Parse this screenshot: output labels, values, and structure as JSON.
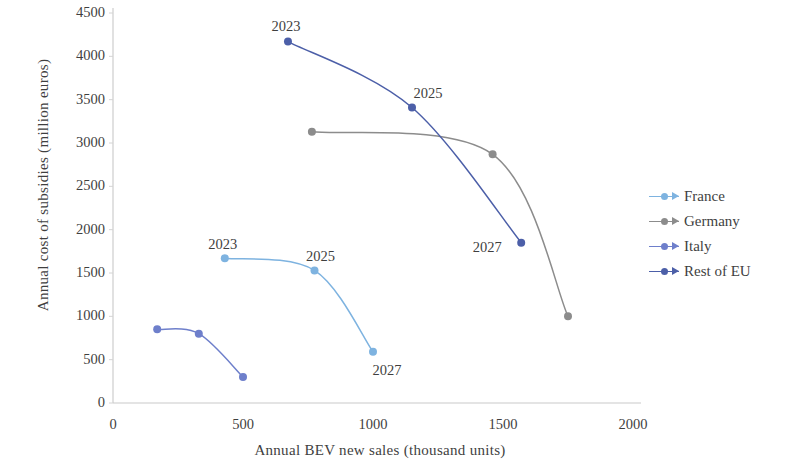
{
  "chart_data": {
    "type": "scatter",
    "title": "",
    "xlabel": "Annual BEV new sales (thousand units)",
    "ylabel": "Annual cost of subsidies (million euros)",
    "xlim": [
      0,
      2000
    ],
    "ylim": [
      0,
      4500
    ],
    "xticks": [
      "0",
      "500",
      "1000",
      "1500",
      "2000"
    ],
    "yticks": [
      "0",
      "500",
      "1000",
      "1500",
      "2000",
      "2500",
      "3000",
      "3500",
      "4000",
      "4500"
    ],
    "grid": false,
    "legend_position": "right",
    "series": [
      {
        "name": "France",
        "color": "#7EB3E0",
        "points": [
          {
            "x": 430,
            "y": 1670,
            "label": "2023"
          },
          {
            "x": 775,
            "y": 1530,
            "label": "2025"
          },
          {
            "x": 1000,
            "y": 590,
            "label": "2027"
          }
        ]
      },
      {
        "name": "Germany",
        "color": "#8C8C8C",
        "points": [
          {
            "x": 765,
            "y": 3130,
            "label": ""
          },
          {
            "x": 1460,
            "y": 2870,
            "label": ""
          },
          {
            "x": 1750,
            "y": 1000,
            "label": ""
          }
        ]
      },
      {
        "name": "Italy",
        "color": "#6E7FCB",
        "points": [
          {
            "x": 170,
            "y": 850,
            "label": ""
          },
          {
            "x": 330,
            "y": 800,
            "label": ""
          },
          {
            "x": 500,
            "y": 300,
            "label": ""
          }
        ]
      },
      {
        "name": "Rest of EU",
        "color": "#4C5FA8",
        "points": [
          {
            "x": 673,
            "y": 4170,
            "label": "2023"
          },
          {
            "x": 1150,
            "y": 3410,
            "label": "2025"
          },
          {
            "x": 1570,
            "y": 1850,
            "label": "2027"
          }
        ]
      }
    ],
    "annotations": [
      {
        "text": "2023",
        "series": "France",
        "x": 430,
        "y": 1670
      },
      {
        "text": "2025",
        "series": "France",
        "x": 775,
        "y": 1530
      },
      {
        "text": "2027",
        "series": "France",
        "x": 1000,
        "y": 590
      },
      {
        "text": "2023",
        "series": "Rest of EU",
        "x": 673,
        "y": 4170
      },
      {
        "text": "2025",
        "series": "Rest of EU",
        "x": 1150,
        "y": 3410
      },
      {
        "text": "2027",
        "series": "Rest of EU",
        "x": 1570,
        "y": 1850
      }
    ]
  },
  "axes": {
    "x_title": "Annual BEV new sales (thousand units)",
    "y_title": "Annual cost of subsidies (million euros)"
  },
  "legend": {
    "items": [
      {
        "label": "France",
        "color": "#7EB3E0"
      },
      {
        "label": "Germany",
        "color": "#8C8C8C"
      },
      {
        "label": "Italy",
        "color": "#6E7FCB"
      },
      {
        "label": "Rest of EU",
        "color": "#4C5FA8"
      }
    ]
  }
}
